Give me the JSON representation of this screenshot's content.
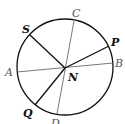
{
  "diagram": {
    "type": "circle-with-chords",
    "center": {
      "label": "N",
      "x": 65,
      "y": 68
    },
    "circle": {
      "cx": 65,
      "cy": 67,
      "r": 48,
      "stroke": "#111111"
    },
    "points": [
      {
        "label": "C",
        "x": 74,
        "y": 21,
        "lx": 72,
        "ly": 17,
        "weight": "thin"
      },
      {
        "label": "D",
        "x": 57,
        "y": 114,
        "lx": 51,
        "ly": 126,
        "weight": "thin"
      },
      {
        "label": "A",
        "x": 17,
        "y": 72,
        "lx": 6,
        "ly": 75,
        "weight": "thin"
      },
      {
        "label": "B",
        "x": 113,
        "y": 63,
        "lx": 115,
        "ly": 66,
        "weight": "thin"
      },
      {
        "label": "S",
        "x": 30,
        "y": 35,
        "lx": 23,
        "ly": 33,
        "weight": "bold"
      },
      {
        "label": "P",
        "x": 109,
        "y": 46,
        "lx": 111,
        "ly": 46,
        "weight": "bold"
      },
      {
        "label": "Q",
        "x": 35,
        "y": 105,
        "lx": 24,
        "ly": 117,
        "weight": "bold"
      }
    ],
    "segments": [
      {
        "name": "line-CD",
        "from": "C",
        "to": "D",
        "stroke": "#555555",
        "width": 0.8
      },
      {
        "name": "line-AB",
        "from": "A",
        "to": "B",
        "stroke": "#555555",
        "width": 0.8
      },
      {
        "name": "segment-SN",
        "from": "S",
        "to": "N",
        "stroke": "#111111",
        "width": 1.3
      },
      {
        "name": "segment-NP",
        "from": "N",
        "to": "P",
        "stroke": "#111111",
        "width": 1.3
      },
      {
        "name": "segment-NQ",
        "from": "N",
        "to": "Q",
        "stroke": "#111111",
        "width": 1.3
      }
    ],
    "labels": {
      "C": "C",
      "D": "D",
      "A": "A",
      "B": "B",
      "S": "S",
      "P": "P",
      "Q": "Q",
      "N": "N"
    }
  }
}
